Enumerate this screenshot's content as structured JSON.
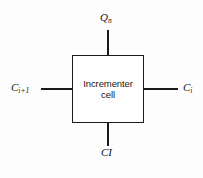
{
  "diagram": {
    "block": {
      "name": "incrementer-cell",
      "label": "Incrementer\ncell",
      "line1": "Incrementer",
      "line2": "cell"
    },
    "ports": [
      {
        "id": "qn",
        "label_base": "Q",
        "label_sub": "n",
        "label_full": "Qn",
        "side": "top"
      },
      {
        "id": "ci1",
        "label_base": "C",
        "label_sub": "i+1",
        "label_full": "Ci+1",
        "side": "left"
      },
      {
        "id": "ci",
        "label_base": "C",
        "label_sub": "i",
        "label_full": "Ci",
        "side": "right"
      },
      {
        "id": "cl",
        "label_base": "CI",
        "label_sub": "",
        "label_full": "CI",
        "side": "bottom"
      }
    ],
    "colors": {
      "line": "#1b1b1b",
      "text": "#141414",
      "background": "#fdfdfd",
      "box_fill": "#ffffff"
    }
  }
}
